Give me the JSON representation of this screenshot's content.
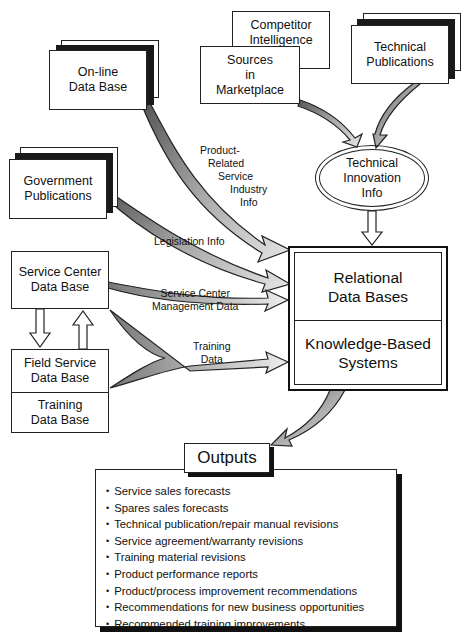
{
  "diagram": {
    "sources": {
      "online_db": "On-line\nData Base",
      "competitor_intelligence": "Competitor\nIntelligence",
      "sources_marketplace": "Sources\nin\nMarketplace",
      "technical_publications": "Technical\nPublications",
      "government_publications": "Government\nPublications",
      "service_center_db": "Service Center\nData Base",
      "field_service_db": "Field Service\nData Base",
      "training_db": "Training\nData Base"
    },
    "hub": {
      "technical_innovation": "Technical\nInnovation\nInfo",
      "relational_db": "Relational\nData Bases",
      "knowledge_systems": "Knowledge-Based\nSystems"
    },
    "flow_labels": {
      "product_related": "Product-\nRelated\nService\nIndustry\nInfo",
      "legislation": "Legislation Info",
      "service_center_mgmt": "Service Center\nManagement Data",
      "training_data": "Training\nData"
    },
    "outputs": {
      "title": "Outputs",
      "items": [
        "Service sales forecasts",
        "Spares sales forecasts",
        "Technical publication/repair manual revisions",
        "Service agreement/warranty revisions",
        "Training material revisions",
        "Product performance reports",
        "Product/process improvement recommendations",
        "Recommendations for new business opportunities",
        "Recommended training improvements"
      ]
    }
  }
}
